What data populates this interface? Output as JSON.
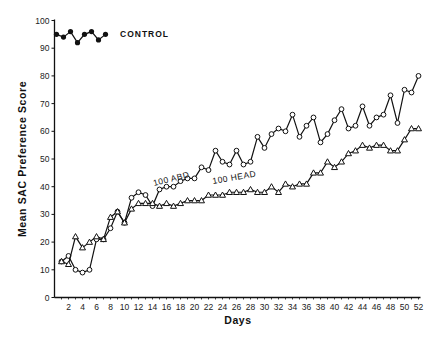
{
  "chart_data": {
    "type": "line",
    "title": "",
    "xlabel": "Days",
    "ylabel": "Mean SAC Preference Score",
    "xlim": [
      0,
      52
    ],
    "ylim": [
      0,
      100
    ],
    "x_ticks": [
      2,
      4,
      6,
      8,
      10,
      12,
      14,
      16,
      18,
      20,
      22,
      24,
      26,
      28,
      30,
      32,
      34,
      36,
      38,
      40,
      42,
      44,
      46,
      48,
      50,
      52
    ],
    "y_ticks": [
      0,
      10,
      20,
      30,
      40,
      50,
      60,
      70,
      80,
      90,
      100
    ],
    "grid": false,
    "legend": "inline labels",
    "series": [
      {
        "name": "CONTROL",
        "marker": "filled-circle",
        "x": [
          1,
          2,
          3,
          4,
          5,
          6,
          7,
          8
        ],
        "values": [
          95,
          94,
          96,
          92,
          95,
          96,
          93,
          95
        ]
      },
      {
        "name": "100 ABD",
        "marker": "open-circle",
        "x": [
          1,
          2,
          3,
          4,
          5,
          6,
          7,
          8,
          9,
          10,
          11,
          12,
          13,
          14,
          15,
          16,
          17,
          18,
          19,
          20,
          21,
          22,
          23,
          24,
          25,
          26,
          27,
          28,
          29,
          30,
          31,
          32,
          33,
          34,
          35,
          36,
          37,
          38,
          39,
          40,
          41,
          42,
          43,
          44,
          45,
          46,
          47,
          48,
          49,
          50,
          51,
          52
        ],
        "values": [
          13,
          15,
          10,
          9,
          10,
          21,
          21,
          25,
          31,
          27,
          36,
          38,
          37,
          33,
          39,
          40,
          40,
          42,
          43,
          43,
          47,
          46,
          53,
          49,
          48,
          53,
          48,
          49,
          58,
          54,
          59,
          61,
          60,
          66,
          58,
          62,
          65,
          56,
          59,
          64,
          68,
          61,
          62,
          69,
          62,
          65,
          66,
          73,
          63,
          75,
          74,
          80
        ]
      },
      {
        "name": "100 HEAD",
        "marker": "open-triangle",
        "x": [
          1,
          2,
          3,
          4,
          5,
          6,
          7,
          8,
          9,
          10,
          11,
          12,
          13,
          14,
          15,
          16,
          17,
          18,
          19,
          20,
          21,
          22,
          23,
          24,
          25,
          26,
          27,
          28,
          29,
          30,
          31,
          32,
          33,
          34,
          35,
          36,
          37,
          38,
          39,
          40,
          41,
          42,
          43,
          44,
          45,
          46,
          47,
          48,
          49,
          50,
          51,
          52
        ],
        "values": [
          13,
          12,
          22,
          18,
          20,
          22,
          21,
          29,
          31,
          27,
          32,
          34,
          34,
          34,
          33,
          34,
          33,
          34,
          35,
          35,
          35,
          37,
          37,
          37,
          38,
          38,
          38,
          39,
          38,
          38,
          40,
          38,
          41,
          40,
          41,
          41,
          45,
          45,
          49,
          47,
          49,
          52,
          53,
          55,
          54,
          55,
          55,
          53,
          53,
          57,
          61,
          61
        ]
      }
    ],
    "annotations": [
      {
        "text": "CONTROL",
        "x": 10,
        "y": 95
      },
      {
        "text": "100 ABD",
        "x": 14,
        "y": 44
      },
      {
        "text": "100 HEAD",
        "x": 19,
        "y": 40
      }
    ]
  },
  "labels": {
    "xlabel": "Days",
    "ylabel": "Mean SAC Preference Score",
    "control": "CONTROL",
    "abd": "100 ABD",
    "head": "100 HEAD"
  }
}
